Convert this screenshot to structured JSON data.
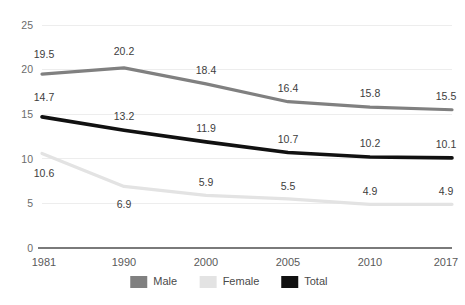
{
  "chart_data": {
    "type": "line",
    "title": "",
    "subtitle": "",
    "xlabel": "",
    "ylabel": "",
    "categories": [
      "1981",
      "1990",
      "2000",
      "2005",
      "2010",
      "2017"
    ],
    "ylim": [
      0,
      25
    ],
    "yticks": [
      0,
      5,
      10,
      15,
      20,
      25
    ],
    "ytick_labels": [
      "0",
      "5",
      "10",
      "15",
      "20",
      "25"
    ],
    "grid": true,
    "legend_position": "bottom-center",
    "series": [
      {
        "name": "Male",
        "color": "#808080",
        "values": [
          19.5,
          20.2,
          18.4,
          16.4,
          15.8,
          15.5
        ],
        "labels": [
          "19.5",
          "20.2",
          "18.4",
          "16.4",
          "15.8",
          "15.5"
        ]
      },
      {
        "name": "Female",
        "color": "#e3e3e3",
        "values": [
          10.6,
          6.9,
          5.9,
          5.5,
          4.9,
          4.9
        ],
        "labels": [
          "10.6",
          "6.9",
          "5.9",
          "5.5",
          "4.9",
          "4.9"
        ]
      },
      {
        "name": "Total",
        "color": "#111111",
        "values": [
          14.7,
          13.2,
          11.9,
          10.7,
          10.2,
          10.1
        ],
        "labels": [
          "14.7",
          "13.2",
          "11.9",
          "10.7",
          "10.2",
          "10.1"
        ]
      }
    ]
  },
  "legend": {
    "items": [
      {
        "label": "Male",
        "swatch_color": "#808080"
      },
      {
        "label": "Female",
        "swatch_color": "#e3e3e3"
      },
      {
        "label": "Total",
        "swatch_color": "#111111"
      }
    ]
  },
  "axes": {
    "y_axis_name": "value-axis",
    "x_axis_name": "category-axis"
  }
}
